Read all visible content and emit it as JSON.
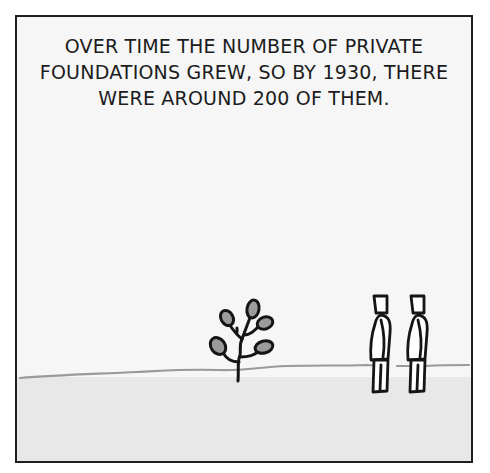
{
  "panel": {
    "caption": {
      "lines": [
        "OVER TIME THE NUMBER OF PRIVATE",
        "FOUNDATIONS GREW, SO BY 1930, THERE",
        "WERE AROUND 200 OF THEM."
      ]
    },
    "scene": {
      "elements": [
        "horizon-line",
        "sapling-plant",
        "stick-figure-left",
        "stick-figure-right"
      ]
    },
    "colors": {
      "border": "#1e1e1e",
      "sky": "#f6f6f6",
      "ground": "#e8e8e8",
      "horizon": "#9a9a9a",
      "leaf_fill": "#9b9b9b",
      "ink": "#151515"
    }
  }
}
